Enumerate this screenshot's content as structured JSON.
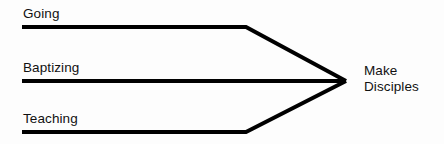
{
  "diagram": {
    "type": "convergence-arrow-diagram",
    "background_color": "#fdfdfd",
    "line_color": "#000000",
    "text_color": "#111111",
    "line_width": 4,
    "branches": [
      {
        "id": "going",
        "label": "Going",
        "label_x": 23,
        "label_y": 6,
        "line_start_x": 22,
        "line_y": 27,
        "bend_x": 246,
        "converges_to": "make-disciples"
      },
      {
        "id": "baptizing",
        "label": "Baptizing",
        "label_x": 23,
        "label_y": 60,
        "line_start_x": 22,
        "line_y": 81,
        "bend_x": 246,
        "converges_to": "make-disciples"
      },
      {
        "id": "teaching",
        "label": "Teaching",
        "label_x": 23,
        "label_y": 111,
        "line_start_x": 22,
        "line_y": 132,
        "bend_x": 246,
        "converges_to": "make-disciples"
      }
    ],
    "apex": {
      "id": "make-disciples",
      "x": 346,
      "y": 81,
      "label_line_1": "Make",
      "label_line_2": "Disciples",
      "label_x": 364,
      "label_y": 63
    }
  }
}
